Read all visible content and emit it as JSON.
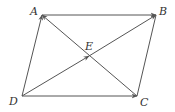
{
  "diagram": {
    "line_color": "#555555",
    "label_color": "#333333",
    "points": {
      "A": {
        "label": "A",
        "x": 42,
        "y": 15
      },
      "B": {
        "label": "B",
        "x": 156,
        "y": 15
      },
      "C": {
        "label": "C",
        "x": 137,
        "y": 96
      },
      "D": {
        "label": "D",
        "x": 22,
        "y": 96
      },
      "E": {
        "label": "E",
        "x": 89,
        "y": 56
      }
    },
    "vectors": [
      {
        "from": "A",
        "to": "B",
        "arrow": true
      },
      {
        "from": "D",
        "to": "A",
        "arrow": true
      },
      {
        "from": "D",
        "to": "C",
        "arrow": true
      },
      {
        "from": "B",
        "to": "C",
        "arrow": false
      },
      {
        "from": "D",
        "to": "E",
        "arrow": true
      },
      {
        "from": "E",
        "to": "B",
        "arrow": true
      },
      {
        "from": "C",
        "to": "A",
        "arrow": true
      }
    ]
  }
}
